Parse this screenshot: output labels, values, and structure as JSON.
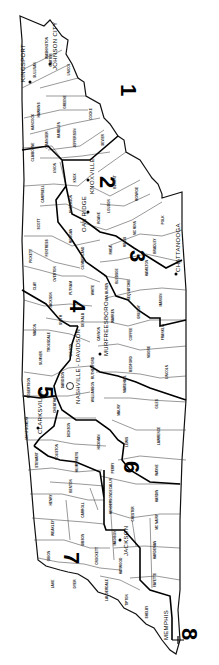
{
  "map": {
    "title": "Tennessee Congressional Districts",
    "orientation": "rotated 90 degrees clockwise",
    "districts": [
      {
        "number": "1",
        "x": 128,
        "y": 95
      },
      {
        "number": "2",
        "x": 106,
        "y": 188
      },
      {
        "number": "3",
        "x": 136,
        "y": 262
      },
      {
        "number": "4",
        "x": 76,
        "y": 312
      },
      {
        "number": "5",
        "x": 44,
        "y": 398
      },
      {
        "number": "6",
        "x": 130,
        "y": 473
      },
      {
        "number": "7",
        "x": 70,
        "y": 564
      },
      {
        "number": "8",
        "x": 188,
        "y": 640
      }
    ],
    "cities": [
      {
        "name": "KINGSPORT",
        "x": 28,
        "y": 80,
        "dot": true
      },
      {
        "name": "JOHNSON CITY",
        "x": 56,
        "y": 62,
        "dot": true
      },
      {
        "name": "KNOXVILLE",
        "x": 92,
        "y": 188,
        "dot": true
      },
      {
        "name": "OAK RIDGE",
        "x": 84,
        "y": 222,
        "dot": true
      },
      {
        "name": "CHATTANOOGA",
        "x": 178,
        "y": 268,
        "dot": true
      },
      {
        "name": "MURFREESBORO",
        "x": 106,
        "y": 340,
        "dot": true
      },
      {
        "name": "NASHVILLE - DAVIDSON",
        "x": 80,
        "y": 378,
        "dot": false,
        "capitol": true
      },
      {
        "name": "CLARKSVILLE",
        "x": 38,
        "y": 420,
        "dot": true
      },
      {
        "name": "JACKSON",
        "x": 126,
        "y": 542,
        "dot": true
      },
      {
        "name": "MEMPHIS",
        "x": 168,
        "y": 630,
        "dot": false
      }
    ],
    "counties": [
      {
        "name": "HAWKINS",
        "x": 40,
        "y": 110
      },
      {
        "name": "SULLIVAN",
        "x": 36,
        "y": 70
      },
      {
        "name": "WASHINGTON",
        "x": 48,
        "y": 48
      },
      {
        "name": "CARTER",
        "x": 52,
        "y": 60
      },
      {
        "name": "UNICOI",
        "x": 70,
        "y": 70
      },
      {
        "name": "GREENE",
        "x": 66,
        "y": 102
      },
      {
        "name": "HANCOCK",
        "x": 34,
        "y": 122
      },
      {
        "name": "HAMBLEN",
        "x": 60,
        "y": 130
      },
      {
        "name": "GRAINGER",
        "x": 48,
        "y": 140
      },
      {
        "name": "JEFFERSON",
        "x": 76,
        "y": 138
      },
      {
        "name": "COCKE",
        "x": 92,
        "y": 114
      },
      {
        "name": "SEVIER",
        "x": 104,
        "y": 140
      },
      {
        "name": "CLAIBORNE",
        "x": 34,
        "y": 152
      },
      {
        "name": "UNION",
        "x": 56,
        "y": 168
      },
      {
        "name": "KNOX",
        "x": 76,
        "y": 178
      },
      {
        "name": "BLOUNT",
        "x": 116,
        "y": 182
      },
      {
        "name": "CAMPBELL",
        "x": 44,
        "y": 194
      },
      {
        "name": "ANDERSON",
        "x": 72,
        "y": 204
      },
      {
        "name": "LOUDON",
        "x": 110,
        "y": 206
      },
      {
        "name": "MONROE",
        "x": 138,
        "y": 194
      },
      {
        "name": "SCOTT",
        "x": 40,
        "y": 224
      },
      {
        "name": "MORGAN",
        "x": 72,
        "y": 236
      },
      {
        "name": "ROANE",
        "x": 100,
        "y": 218
      },
      {
        "name": "MC MINN",
        "x": 136,
        "y": 228
      },
      {
        "name": "POLK",
        "x": 164,
        "y": 220
      },
      {
        "name": "FENTRESS",
        "x": 48,
        "y": 248
      },
      {
        "name": "PICKETT",
        "x": 32,
        "y": 256
      },
      {
        "name": "CUMBERLAND",
        "x": 84,
        "y": 258
      },
      {
        "name": "RHEA",
        "x": 112,
        "y": 250
      },
      {
        "name": "MEIGS",
        "x": 126,
        "y": 242
      },
      {
        "name": "BRADLEY",
        "x": 156,
        "y": 246
      },
      {
        "name": "HAMILTON",
        "x": 148,
        "y": 268
      },
      {
        "name": "BLEDSOE",
        "x": 118,
        "y": 276
      },
      {
        "name": "OVERTON",
        "x": 56,
        "y": 274
      },
      {
        "name": "CLAY",
        "x": 36,
        "y": 286
      },
      {
        "name": "JACKSON",
        "x": 52,
        "y": 300
      },
      {
        "name": "PUTNAM",
        "x": 72,
        "y": 288
      },
      {
        "name": "WHITE",
        "x": 94,
        "y": 290
      },
      {
        "name": "VAN BUREN",
        "x": 108,
        "y": 292
      },
      {
        "name": "SEQUATCHIE",
        "x": 130,
        "y": 290
      },
      {
        "name": "MARION",
        "x": 162,
        "y": 300
      },
      {
        "name": "GRUNDY",
        "x": 140,
        "y": 312
      },
      {
        "name": "WARREN",
        "x": 114,
        "y": 316
      },
      {
        "name": "DE KALB",
        "x": 84,
        "y": 320
      },
      {
        "name": "SMITH",
        "x": 62,
        "y": 320
      },
      {
        "name": "MACON",
        "x": 36,
        "y": 330
      },
      {
        "name": "TROUSDALE",
        "x": 50,
        "y": 342
      },
      {
        "name": "WILSON",
        "x": 72,
        "y": 350
      },
      {
        "name": "CANNON",
        "x": 100,
        "y": 334
      },
      {
        "name": "COFFEE",
        "x": 132,
        "y": 334
      },
      {
        "name": "FRANKLIN",
        "x": 164,
        "y": 332
      },
      {
        "name": "SUMNER",
        "x": 42,
        "y": 358
      },
      {
        "name": "RUTHERFORD",
        "x": 94,
        "y": 368
      },
      {
        "name": "BEDFORD",
        "x": 132,
        "y": 364
      },
      {
        "name": "MOORE",
        "x": 150,
        "y": 352
      },
      {
        "name": "LINCOLN",
        "x": 168,
        "y": 372
      },
      {
        "name": "ROBERTSON",
        "x": 30,
        "y": 388
      },
      {
        "name": "DAVIDSON",
        "x": 64,
        "y": 380
      },
      {
        "name": "CHEATHAM",
        "x": 56,
        "y": 404
      },
      {
        "name": "MARSHALL",
        "x": 126,
        "y": 384
      },
      {
        "name": "WILLIAMSON",
        "x": 94,
        "y": 392
      },
      {
        "name": "MAURY",
        "x": 120,
        "y": 410
      },
      {
        "name": "GILES",
        "x": 158,
        "y": 404
      },
      {
        "name": "MONTGOMERY",
        "x": 28,
        "y": 428
      },
      {
        "name": "DICKSON",
        "x": 70,
        "y": 430
      },
      {
        "name": "HICKMAN",
        "x": 100,
        "y": 442
      },
      {
        "name": "LEWIS",
        "x": 128,
        "y": 442
      },
      {
        "name": "LAWRENCE",
        "x": 160,
        "y": 436
      },
      {
        "name": "STEWART",
        "x": 38,
        "y": 460
      },
      {
        "name": "HOUSTON",
        "x": 58,
        "y": 452
      },
      {
        "name": "HUMPHREYS",
        "x": 78,
        "y": 462
      },
      {
        "name": "PERRY",
        "x": 114,
        "y": 468
      },
      {
        "name": "WAYNE",
        "x": 158,
        "y": 470
      },
      {
        "name": "BENTON",
        "x": 72,
        "y": 486
      },
      {
        "name": "DECALUR",
        "x": 112,
        "y": 486
      },
      {
        "name": "HARDIN",
        "x": 158,
        "y": 496
      },
      {
        "name": "HENRY",
        "x": 52,
        "y": 500
      },
      {
        "name": "CARROLL",
        "x": 84,
        "y": 510
      },
      {
        "name": "HENDERSON",
        "x": 112,
        "y": 504
      },
      {
        "name": "CHESTER",
        "x": 134,
        "y": 514
      },
      {
        "name": "MC NAIRY",
        "x": 158,
        "y": 522
      },
      {
        "name": "WEAKLEY",
        "x": 54,
        "y": 528
      },
      {
        "name": "GIBSON",
        "x": 84,
        "y": 540
      },
      {
        "name": "MADISON",
        "x": 116,
        "y": 538
      },
      {
        "name": "HARDEMAN",
        "x": 156,
        "y": 550
      },
      {
        "name": "OBION",
        "x": 50,
        "y": 556
      },
      {
        "name": "CROCKETT",
        "x": 98,
        "y": 556
      },
      {
        "name": "HAYWOOD",
        "x": 122,
        "y": 566
      },
      {
        "name": "FAYETTE",
        "x": 156,
        "y": 580
      },
      {
        "name": "LAKE",
        "x": 54,
        "y": 584
      },
      {
        "name": "DYER",
        "x": 76,
        "y": 584
      },
      {
        "name": "LAUDERDALE",
        "x": 108,
        "y": 590
      },
      {
        "name": "TIPTON",
        "x": 128,
        "y": 600
      },
      {
        "name": "SHELBY",
        "x": 148,
        "y": 612
      }
    ]
  }
}
